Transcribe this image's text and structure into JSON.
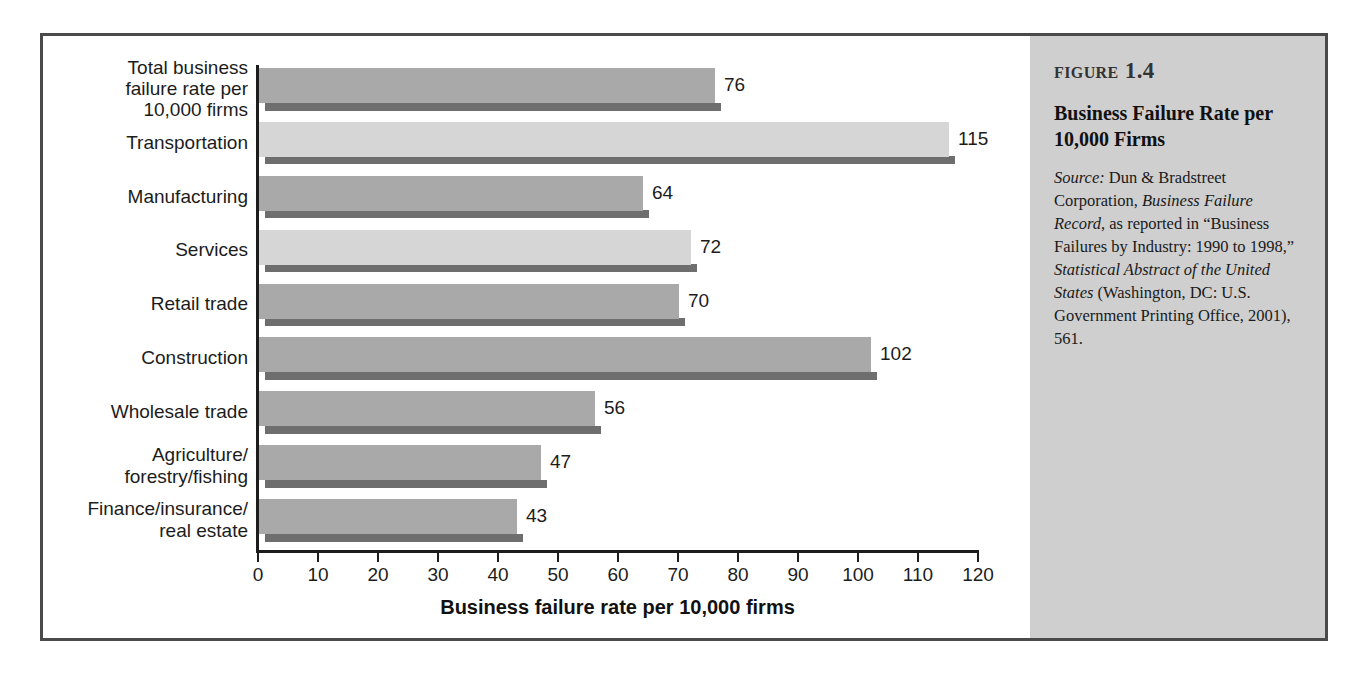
{
  "figure": {
    "number_word": "Figure",
    "number": "1.4",
    "title": "Business Failure Rate per 10,000 Firms",
    "source_label": "Source:",
    "source_part1": " Dun & Bradstreet Corporation, ",
    "source_italic1": "Business Failure Record",
    "source_part2": ", as reported in “Business Failures by Industry: 1990 to 1998,” ",
    "source_italic2": "Statistical Abstract of the United States",
    "source_part3": " (Washington, DC: U.S. Government Printing Office, 2001), 561."
  },
  "colors": {
    "frame_border": "#4a4a4a",
    "sidebar_bg": "#cfcfcf",
    "bar_medium": "#a9a9a9",
    "bar_light": "#d6d6d6",
    "bar_shadow": "#6e6e6e",
    "axis": "#1c1c1c"
  },
  "chart_data": {
    "type": "bar",
    "orientation": "horizontal",
    "title": "",
    "xlabel": "Business failure rate per 10,000 firms",
    "ylabel": "",
    "xlim": [
      0,
      120
    ],
    "xticks": [
      0,
      10,
      20,
      30,
      40,
      50,
      60,
      70,
      80,
      90,
      100,
      110,
      120
    ],
    "grid": false,
    "legend": false,
    "categories": [
      "Total business failure rate per 10,000 firms",
      "Transportation",
      "Manufacturing",
      "Services",
      "Retail trade",
      "Construction",
      "Wholesale trade",
      "Agriculture/forestry/fishing",
      "Finance/insurance/real estate"
    ],
    "category_lines": [
      [
        "Total business",
        "failure rate per",
        "10,000 firms"
      ],
      [
        "Transportation"
      ],
      [
        "Manufacturing"
      ],
      [
        "Services"
      ],
      [
        "Retail trade"
      ],
      [
        "Construction"
      ],
      [
        "Wholesale trade"
      ],
      [
        "Agriculture/",
        "forestry/fishing"
      ],
      [
        "Finance/insurance/",
        "real estate"
      ]
    ],
    "values": [
      76,
      115,
      64,
      72,
      70,
      102,
      56,
      47,
      43
    ],
    "bar_shades": [
      "medium",
      "light",
      "medium",
      "light",
      "medium",
      "medium",
      "medium",
      "medium",
      "medium"
    ]
  }
}
